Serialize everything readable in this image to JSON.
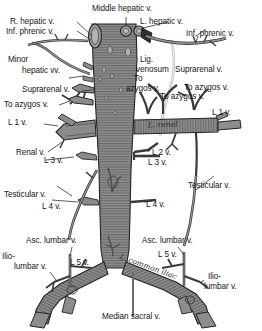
{
  "figure": {
    "background_color": "#ffffff",
    "vessel_fill": "#8a8a8a",
    "vessel_stroke": "#2a2a2a",
    "hatch_color": "#4a4a4a",
    "ligament_color": "#c9c9c9",
    "label_color": "#161616"
  },
  "labels": {
    "r_hepatic": "R. hepatic v.",
    "inf_phrenic_left": "Inf. phrenic v.",
    "middle_hepatic": "Middle hepatic v.",
    "l_hepatic": "L. hepatic v.",
    "inf_phrenic_right": "Inf. phrenic v.",
    "minor_line1": "Minor",
    "minor_line2": "hepatic vv.",
    "lig_line1": "Lig.",
    "lig_line2": "venosum",
    "suprarenal_left": "Suprarenal v.",
    "suprarenal_right": "Suprarenal v.",
    "to_azygos_center_line1": "To",
    "to_azygos_center_line2": "azygos v.",
    "to_azygos_left": "To azygos v.",
    "to_azygos_right_upper": "To azygos v.",
    "to_azygos_right_lower": "To azygos v.",
    "l1_left": "L 1 v.",
    "l1_right": "L 1 v.",
    "renal_left": "Renal v.",
    "l_renal_script": "L. renal",
    "l2_right": "L 2 v.",
    "l3_left": "L 3 v.",
    "l3_right": "L 3 v.",
    "testicular_left": "Testicular v.",
    "testicular_right": "Testicular v.",
    "l4_left": "L 4 v.",
    "l4_right": "L 4 v.",
    "iliac_script": "L. common iliac",
    "asc_lumbar_left": "Asc. lumbar v.",
    "asc_lumbar_right": "Asc. lumbar v.",
    "ilio_left_line1": "Ilio-",
    "ilio_left_line2": "lumbar v.",
    "ilio_right_line1": "Ilio-",
    "ilio_right_line2": "lumbar v.",
    "l5_left": "L 5 v.",
    "l5_right": "L 5 v.",
    "median_sacral": "Median  sacral v."
  }
}
